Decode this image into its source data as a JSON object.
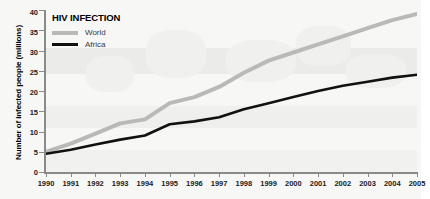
{
  "chart_data": {
    "type": "line",
    "title": "HIV INFECTION",
    "xlabel": "",
    "ylabel": "Number of infected people (millions)",
    "xlim": [
      1990,
      2005
    ],
    "ylim": [
      0,
      40
    ],
    "yticks": [
      0,
      5,
      10,
      15,
      20,
      25,
      30,
      35,
      40
    ],
    "grid": false,
    "legend_position": "top-left",
    "x": [
      1990,
      1991,
      1992,
      1993,
      1994,
      1995,
      1996,
      1997,
      1998,
      1999,
      2000,
      2001,
      2002,
      2003,
      2004,
      2005
    ],
    "series": [
      {
        "name": "World",
        "color": "#b9b9b7",
        "values": [
          5.0,
          7.0,
          9.5,
          12.0,
          13.0,
          17.0,
          18.5,
          21.0,
          24.5,
          27.5,
          29.5,
          31.5,
          33.5,
          35.5,
          37.5,
          39.0
        ]
      },
      {
        "name": "Africa",
        "color": "#111111",
        "values": [
          4.5,
          5.5,
          6.8,
          8.0,
          9.0,
          11.8,
          12.5,
          13.5,
          15.5,
          17.0,
          18.5,
          20.0,
          21.3,
          22.3,
          23.3,
          24.0
        ]
      }
    ],
    "xticks": [
      "1990",
      "1991",
      "1992",
      "1993",
      "1994",
      "1995",
      "1996",
      "1997",
      "1998",
      "1999",
      "2000",
      "2001",
      "2002",
      "2003",
      "2004",
      "2005"
    ]
  },
  "legend": {
    "title": "HIV INFECTION",
    "entries": [
      {
        "label": "World"
      },
      {
        "label": "Africa"
      }
    ]
  },
  "axes": {
    "y_title": "Number of infected people (millions)"
  }
}
